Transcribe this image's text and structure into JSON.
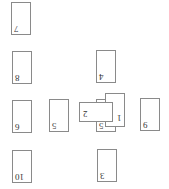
{
  "board": {
    "cards": [
      {
        "id": "card-7",
        "label": "7",
        "x": 11,
        "y": 2,
        "w": 20,
        "h": 33
      },
      {
        "id": "card-8",
        "label": "8",
        "x": 12,
        "y": 51,
        "w": 20,
        "h": 33
      },
      {
        "id": "card-4",
        "label": "4",
        "x": 96,
        "y": 50,
        "w": 20,
        "h": 33
      },
      {
        "id": "card-6",
        "label": "6",
        "x": 12,
        "y": 100,
        "w": 20,
        "h": 33
      },
      {
        "id": "card-5a",
        "label": "5",
        "x": 49,
        "y": 99,
        "w": 20,
        "h": 33
      },
      {
        "id": "card-5b",
        "label": "5",
        "x": 96,
        "y": 99,
        "w": 20,
        "h": 33
      },
      {
        "id": "card-1",
        "label": "1",
        "x": 105,
        "y": 93,
        "w": 20,
        "h": 34
      },
      {
        "id": "card-2",
        "label": "2",
        "x": 79,
        "y": 102,
        "w": 34,
        "h": 20
      },
      {
        "id": "card-9",
        "label": "9",
        "x": 140,
        "y": 98,
        "w": 20,
        "h": 33
      },
      {
        "id": "card-10",
        "label": "10",
        "x": 12,
        "y": 150,
        "w": 20,
        "h": 33
      },
      {
        "id": "card-3",
        "label": "3",
        "x": 97,
        "y": 149,
        "w": 20,
        "h": 33
      }
    ]
  }
}
